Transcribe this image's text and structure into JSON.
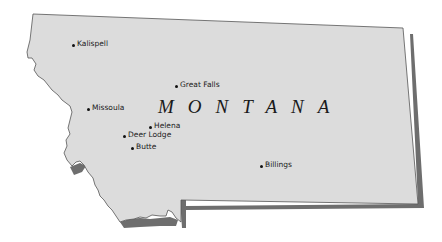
{
  "map": {
    "state_name": "MONTANA",
    "colors": {
      "land": "#dcdcdc",
      "outline": "#555555",
      "shadow": "#6e6e6e",
      "background": "#ffffff"
    },
    "cities": [
      {
        "name": "Kalispell",
        "x": 73,
        "y": 43
      },
      {
        "name": "Great Falls",
        "x": 176,
        "y": 84
      },
      {
        "name": "Missoula",
        "x": 88,
        "y": 107
      },
      {
        "name": "Helena",
        "x": 150,
        "y": 125
      },
      {
        "name": "Deer Lodge",
        "x": 124,
        "y": 134
      },
      {
        "name": "Butte",
        "x": 132,
        "y": 146
      },
      {
        "name": "Billings",
        "x": 261,
        "y": 164
      }
    ]
  }
}
